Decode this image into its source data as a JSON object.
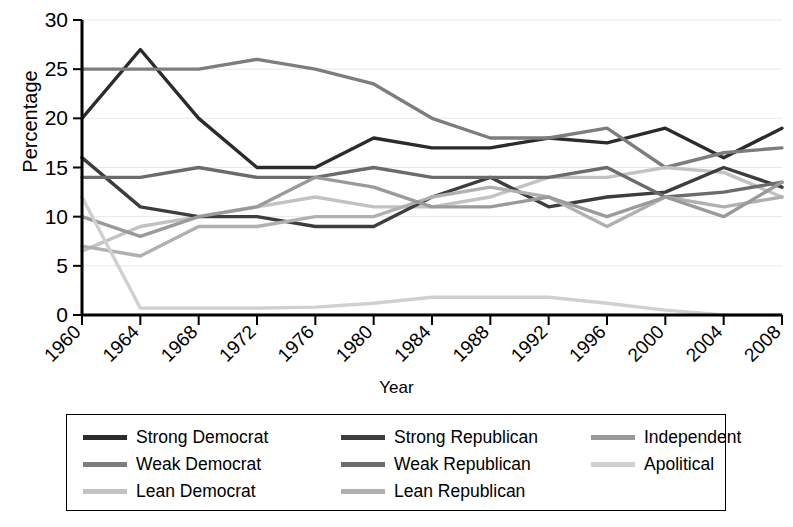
{
  "chart_data": {
    "type": "line",
    "title": "",
    "xlabel": "Year",
    "ylabel": "Percentage",
    "xlim": [
      1960,
      2008
    ],
    "ylim": [
      0,
      30
    ],
    "ytick_step": 5,
    "yticks": [
      "0",
      "5",
      "10",
      "15",
      "20",
      "25",
      "30"
    ],
    "grid": true,
    "grid_axis": "y",
    "legend_position": "bottom",
    "legend_columns": 3,
    "x": [
      1960,
      1964,
      1968,
      1972,
      1976,
      1980,
      1984,
      1988,
      1992,
      1996,
      2000,
      2004,
      2008
    ],
    "categories": [
      "1960",
      "1964",
      "1968",
      "1972",
      "1976",
      "1980",
      "1984",
      "1988",
      "1992",
      "1996",
      "2000",
      "2004",
      "2008"
    ],
    "series": [
      {
        "name": "Strong Democrat",
        "color": "#2b2b2b",
        "values": [
          20,
          27,
          20,
          15,
          15,
          18,
          17,
          17,
          18,
          17.5,
          19,
          16,
          19
        ]
      },
      {
        "name": "Weak Democrat",
        "color": "#7d7d7d",
        "values": [
          25,
          25,
          25,
          26,
          25,
          23.5,
          20,
          18,
          18,
          19,
          15,
          16.5,
          17
        ]
      },
      {
        "name": "Lean Democrat",
        "color": "#c2c2c2",
        "values": [
          6.5,
          9,
          10,
          11,
          12,
          11,
          11,
          12,
          14,
          14,
          15,
          14.5,
          12
        ]
      },
      {
        "name": "Strong Republican",
        "color": "#3d3d3d",
        "values": [
          16,
          11,
          10,
          10,
          9,
          9,
          12,
          14,
          11,
          12,
          12.5,
          15,
          13
        ]
      },
      {
        "name": "Weak Republican",
        "color": "#6b6b6b",
        "values": [
          14,
          14,
          15,
          14,
          14,
          15,
          14,
          14,
          14,
          15,
          12,
          12.5,
          13.5
        ]
      },
      {
        "name": "Lean Republican",
        "color": "#b0b0b0",
        "values": [
          7,
          6,
          9,
          9,
          10,
          10,
          12,
          13,
          12,
          9,
          12,
          11,
          12
        ]
      },
      {
        "name": "Independent",
        "color": "#9a9a9a",
        "values": [
          10,
          8,
          10,
          11,
          14,
          13,
          11,
          11,
          12,
          10,
          12,
          10,
          13.5
        ]
      },
      {
        "name": "Apolitical",
        "color": "#d0d0d0",
        "values": [
          12,
          0.7,
          0.7,
          0.7,
          0.8,
          1.2,
          1.8,
          1.8,
          1.8,
          1.2,
          0.5,
          0,
          0
        ]
      }
    ]
  },
  "legend": {
    "entries": [
      {
        "label": "Strong Democrat",
        "color": "#2b2b2b"
      },
      {
        "label": "Strong Republican",
        "color": "#3d3d3d"
      },
      {
        "label": "Independent",
        "color": "#9a9a9a"
      },
      {
        "label": "Weak Democrat",
        "color": "#7d7d7d"
      },
      {
        "label": "Weak Republican",
        "color": "#6b6b6b"
      },
      {
        "label": "Apolitical",
        "color": "#d0d0d0"
      },
      {
        "label": "Lean Democrat",
        "color": "#c2c2c2"
      },
      {
        "label": "Lean Republican",
        "color": "#b0b0b0"
      }
    ]
  },
  "axes": {
    "y_title": "Percentage",
    "x_title": "Year"
  },
  "style": {
    "axis_color": "#000000",
    "grid_color": "#e8e8e8",
    "background": "#ffffff"
  }
}
